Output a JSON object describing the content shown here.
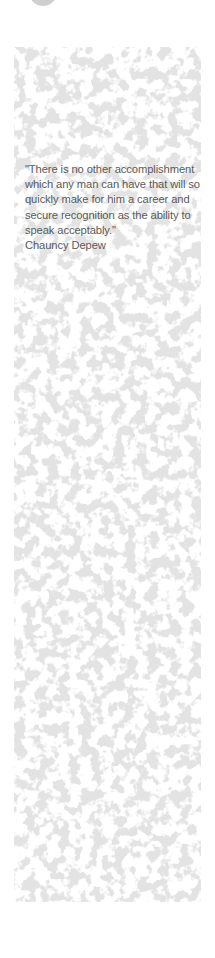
{
  "quote": {
    "text": "\"There is no other accomplishment which any man can have that will so quickly make for him a career and secure recognition as the ability to speak acceptably.\"",
    "author": "Chauncy Depew"
  },
  "colors": {
    "panel_base": "#e3e3e3",
    "text": "#5a5a5a",
    "circle": "#cfcfcf"
  }
}
